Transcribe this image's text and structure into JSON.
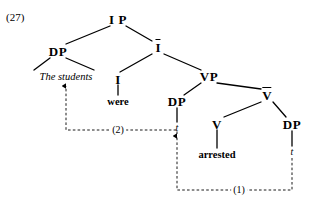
{
  "figure": {
    "example_number": "(27)",
    "caption_type": "x-bar-syntax-tree",
    "ink_color": "#000000",
    "background_color": "#ffffff"
  },
  "tree": {
    "nodes": [
      {
        "id": "ip",
        "label": "I P",
        "x": 118,
        "y": 19,
        "kind": "phrase"
      },
      {
        "id": "dp-subj",
        "label": "DP",
        "x": 58,
        "y": 51,
        "kind": "phrase"
      },
      {
        "id": "i-bar",
        "label": "I",
        "x": 158,
        "y": 47,
        "kind": "bar"
      },
      {
        "id": "i-head",
        "label": "I",
        "x": 118,
        "y": 79,
        "kind": "head"
      },
      {
        "id": "vp",
        "label": "VP",
        "x": 209,
        "y": 76,
        "kind": "phrase"
      },
      {
        "id": "dp-obj",
        "label": "DP",
        "x": 177,
        "y": 101,
        "kind": "phrase"
      },
      {
        "id": "v-bar",
        "label": "V",
        "x": 267,
        "y": 95,
        "kind": "bar"
      },
      {
        "id": "v-head",
        "label": "V",
        "x": 217,
        "y": 124,
        "kind": "head"
      },
      {
        "id": "dp-agent",
        "label": "DP",
        "x": 292,
        "y": 124,
        "kind": "phrase"
      }
    ],
    "terminals": [
      {
        "id": "the-students",
        "label": "The students",
        "x": 66,
        "y": 77,
        "style": "italic"
      },
      {
        "id": "were",
        "label": "were",
        "x": 118,
        "y": 102,
        "style": "roman"
      },
      {
        "id": "arrested",
        "label": "arrested",
        "x": 217,
        "y": 155,
        "style": "roman"
      }
    ],
    "traces": [
      {
        "id": "trace-obj",
        "label": "t",
        "x": 177,
        "y": 128
      },
      {
        "id": "trace-agent",
        "label": "t",
        "x": 292,
        "y": 152
      }
    ],
    "branches": [
      {
        "from": "ip",
        "to": "dp-subj",
        "x1": 110,
        "y1": 26,
        "x2": 66,
        "y2": 44
      },
      {
        "from": "ip",
        "to": "i-bar",
        "x1": 126,
        "y1": 26,
        "x2": 152,
        "y2": 41
      },
      {
        "from": "dp-subj",
        "to": "ts-left",
        "x1": 50,
        "y1": 58,
        "x2": 34,
        "y2": 70
      },
      {
        "from": "dp-subj",
        "to": "ts-right",
        "x1": 66,
        "y1": 58,
        "x2": 94,
        "y2": 70
      },
      {
        "from": "i-bar",
        "to": "i-head",
        "x1": 152,
        "y1": 54,
        "x2": 120,
        "y2": 72
      },
      {
        "from": "i-bar",
        "to": "vp",
        "x1": 164,
        "y1": 54,
        "x2": 201,
        "y2": 70
      },
      {
        "from": "i-head",
        "to": "were",
        "x1": 118,
        "y1": 85,
        "x2": 118,
        "y2": 95
      },
      {
        "from": "vp",
        "to": "dp-obj",
        "x1": 201,
        "y1": 83,
        "x2": 184,
        "y2": 95
      },
      {
        "from": "vp",
        "to": "v-bar",
        "x1": 217,
        "y1": 83,
        "x2": 261,
        "y2": 89
      },
      {
        "from": "dp-obj",
        "to": "trace-obj",
        "x1": 177,
        "y1": 108,
        "x2": 177,
        "y2": 122
      },
      {
        "from": "v-bar",
        "to": "v-head",
        "x1": 261,
        "y1": 102,
        "x2": 224,
        "y2": 117
      },
      {
        "from": "v-bar",
        "to": "dp-agent",
        "x1": 273,
        "y1": 102,
        "x2": 286,
        "y2": 117
      },
      {
        "from": "v-head",
        "to": "arrested",
        "x1": 217,
        "y1": 130,
        "x2": 217,
        "y2": 148
      },
      {
        "from": "dp-agent",
        "to": "trace-ag",
        "x1": 292,
        "y1": 131,
        "x2": 292,
        "y2": 146
      }
    ],
    "movements": [
      {
        "id": "movement-2",
        "label": "(2)",
        "label_x": 118,
        "label_y": 130,
        "description": "subject raising from VP-internal position to spec-IP",
        "path": "M 177 134 L 177 130 L 66 130 L 66 86",
        "arrow_x": 66,
        "arrow_y": 84,
        "arrow_dir": "up"
      },
      {
        "id": "movement-1",
        "label": "(1)",
        "label_x": 239,
        "label_y": 190,
        "description": "object moves to spec-VP leaving a trace",
        "path": "M 292 158 L 292 190 L 177 190 L 177 136",
        "arrow_x": 177,
        "arrow_y": 134,
        "arrow_dir": "up"
      }
    ]
  }
}
